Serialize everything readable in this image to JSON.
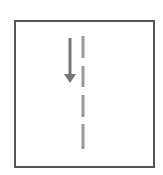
{
  "diagram": {
    "type": "direction-icon",
    "elements": [
      {
        "kind": "frame",
        "shape": "rectangle"
      },
      {
        "kind": "arrow",
        "direction": "down"
      },
      {
        "kind": "dashed-line",
        "orientation": "vertical",
        "dash_count": 4
      }
    ],
    "colors": {
      "frame": "#555555",
      "arrow": "#777777",
      "dashed_line": "#999999",
      "background": "#ffffff"
    }
  }
}
